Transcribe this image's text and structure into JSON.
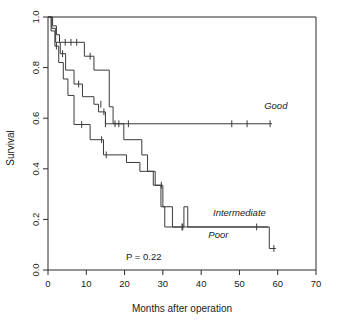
{
  "chart_data": {
    "type": "line",
    "subtype": "kaplan-meier-survival",
    "title": "",
    "xlabel": "Months after operation",
    "ylabel": "Survival",
    "xlim": [
      0,
      70
    ],
    "ylim": [
      0.0,
      1.0
    ],
    "xticks": [
      0,
      10,
      20,
      30,
      40,
      50,
      60,
      70
    ],
    "xticklabels": [
      "0",
      "10",
      "20",
      "30",
      "40",
      "50",
      "60",
      "70"
    ],
    "yticks": [
      0.0,
      0.2,
      0.4,
      0.6,
      0.8,
      1.0
    ],
    "yticklabels": [
      "0.0",
      "0.2",
      "0.4",
      "0.6",
      "0.8",
      "1.0"
    ],
    "grid": false,
    "legend_position": "inline-right-of-curves",
    "annotations": [
      {
        "name": "p-value",
        "text": "P = 0.22",
        "x": 25,
        "y": 0.04
      }
    ],
    "series": [
      {
        "name": "Good",
        "label": "Good",
        "label_x": 59.5,
        "label_y": 0.635,
        "steps": [
          [
            0,
            1.0
          ],
          [
            1.2,
            1.0
          ],
          [
            1.2,
            0.965
          ],
          [
            2.2,
            0.965
          ],
          [
            2.2,
            0.93
          ],
          [
            3.0,
            0.93
          ],
          [
            3.0,
            0.9
          ],
          [
            9.5,
            0.9
          ],
          [
            9.5,
            0.845
          ],
          [
            12.0,
            0.845
          ],
          [
            12.0,
            0.79
          ],
          [
            16.0,
            0.79
          ],
          [
            16.0,
            0.645
          ],
          [
            17.0,
            0.645
          ],
          [
            17.0,
            0.578
          ],
          [
            58.5,
            0.578
          ]
        ],
        "censor_marks": [
          [
            4.5,
            0.9
          ],
          [
            6.0,
            0.9
          ],
          [
            7.5,
            0.9
          ],
          [
            11.0,
            0.845
          ],
          [
            18.5,
            0.578
          ],
          [
            21.0,
            0.578
          ],
          [
            48.0,
            0.578
          ],
          [
            52.0,
            0.578
          ],
          [
            58.0,
            0.578
          ]
        ]
      },
      {
        "name": "Intermediate",
        "label": "Intermediate",
        "label_x": 50.0,
        "label_y": 0.215,
        "steps": [
          [
            0,
            1.0
          ],
          [
            1.0,
            1.0
          ],
          [
            1.0,
            0.955
          ],
          [
            2.0,
            0.955
          ],
          [
            2.0,
            0.9
          ],
          [
            3.2,
            0.9
          ],
          [
            3.2,
            0.855
          ],
          [
            4.6,
            0.855
          ],
          [
            4.6,
            0.79
          ],
          [
            6.8,
            0.79
          ],
          [
            6.8,
            0.735
          ],
          [
            9.0,
            0.735
          ],
          [
            9.0,
            0.685
          ],
          [
            12.0,
            0.685
          ],
          [
            12.0,
            0.655
          ],
          [
            13.2,
            0.655
          ],
          [
            13.2,
            0.625
          ],
          [
            15.0,
            0.625
          ],
          [
            15.0,
            0.578
          ],
          [
            19.8,
            0.578
          ],
          [
            19.8,
            0.515
          ],
          [
            24.5,
            0.515
          ],
          [
            24.5,
            0.455
          ],
          [
            26.0,
            0.455
          ],
          [
            26.0,
            0.39
          ],
          [
            28.0,
            0.39
          ],
          [
            28.0,
            0.335
          ],
          [
            30.0,
            0.335
          ],
          [
            30.0,
            0.25
          ],
          [
            32.5,
            0.25
          ],
          [
            32.5,
            0.17
          ],
          [
            57.5,
            0.17
          ]
        ],
        "censor_marks": [
          [
            3.8,
            0.855
          ],
          [
            8.0,
            0.735
          ],
          [
            13.8,
            0.655
          ],
          [
            14.6,
            0.625
          ],
          [
            15.0,
            0.578
          ],
          [
            17.5,
            0.578
          ],
          [
            35.0,
            0.17
          ],
          [
            54.5,
            0.17
          ]
        ]
      },
      {
        "name": "Poor",
        "label": "Poor",
        "label_x": 44.5,
        "label_y": 0.125,
        "steps": [
          [
            0,
            1.0
          ],
          [
            0.8,
            1.0
          ],
          [
            0.8,
            0.945
          ],
          [
            1.8,
            0.945
          ],
          [
            1.8,
            0.885
          ],
          [
            2.8,
            0.885
          ],
          [
            2.8,
            0.82
          ],
          [
            4.0,
            0.82
          ],
          [
            4.0,
            0.755
          ],
          [
            5.2,
            0.755
          ],
          [
            5.2,
            0.69
          ],
          [
            6.8,
            0.69
          ],
          [
            6.8,
            0.575
          ],
          [
            11.0,
            0.575
          ],
          [
            11.0,
            0.515
          ],
          [
            14.5,
            0.515
          ],
          [
            14.5,
            0.455
          ],
          [
            20.5,
            0.455
          ],
          [
            20.5,
            0.425
          ],
          [
            24.0,
            0.425
          ],
          [
            24.0,
            0.39
          ],
          [
            27.5,
            0.39
          ],
          [
            27.5,
            0.335
          ],
          [
            29.5,
            0.335
          ],
          [
            29.5,
            0.25
          ],
          [
            30.5,
            0.25
          ],
          [
            30.5,
            0.17
          ],
          [
            35.5,
            0.17
          ],
          [
            35.5,
            0.25
          ],
          [
            36.5,
            0.25
          ],
          [
            36.5,
            0.17
          ],
          [
            57.8,
            0.17
          ],
          [
            57.8,
            0.085
          ],
          [
            59.5,
            0.085
          ]
        ],
        "censor_marks": [
          [
            2.2,
            0.885
          ],
          [
            8.8,
            0.575
          ],
          [
            14.0,
            0.515
          ],
          [
            15.2,
            0.455
          ],
          [
            29.6,
            0.335
          ],
          [
            35.2,
            0.17
          ],
          [
            59.0,
            0.085
          ]
        ]
      }
    ]
  },
  "colors": {
    "axis": "#2b2b2b",
    "curve": "#3a3a3a",
    "background": "#ffffff",
    "text": "#1a1a1a"
  }
}
